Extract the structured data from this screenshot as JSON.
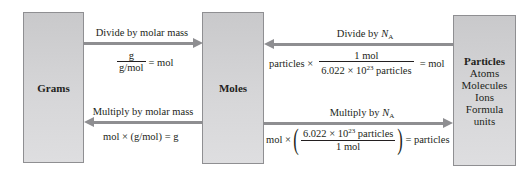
{
  "boxes": {
    "grams": {
      "label": "Grams"
    },
    "moles": {
      "label": "Moles"
    },
    "particles": {
      "label": "Particles",
      "items": [
        "Atoms",
        "Molecules",
        "Ions",
        "Formula units"
      ]
    }
  },
  "conversions": {
    "grams_to_moles": {
      "caption": "Divide by molar mass",
      "equation": {
        "numerator": "g",
        "denominator": "g/mol",
        "result": "= mol"
      }
    },
    "moles_to_grams": {
      "caption": "Multiply by molar mass",
      "equation": {
        "text": "mol × (g/mol) = g"
      }
    },
    "particles_to_moles": {
      "caption_prefix": "Divide by ",
      "caption_symbol": "N",
      "caption_subscript": "A",
      "equation": {
        "prefix": "particles ×",
        "numerator": "1 mol",
        "denominator_base": "6.022 × 10",
        "denominator_exp": "23",
        "denominator_suffix": " particles",
        "result": "= mol"
      }
    },
    "moles_to_particles": {
      "caption_prefix": "Multiply by ",
      "caption_symbol": "N",
      "caption_subscript": "A",
      "equation": {
        "prefix": "mol ×",
        "open_paren": "(",
        "numerator_base": "6.022 × 10",
        "numerator_exp": "23",
        "numerator_suffix": " particles",
        "denominator": "1 mol",
        "close_paren": ")",
        "result": "= particles"
      }
    }
  },
  "colors": {
    "box_fill": "#d3d3d5",
    "box_border": "#8f8f92",
    "arrow": "#8e8e91",
    "text": "#231f20"
  }
}
